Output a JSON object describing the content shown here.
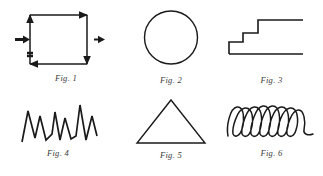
{
  "plate": {
    "background_color": "#ffffff",
    "ink_color": "#1a1a1a",
    "caption_color": "#3a3a3a",
    "columns": 3,
    "rows": 2
  },
  "figures": [
    {
      "id": "fig1",
      "caption": "Fig. 1",
      "shape_name": "square-with-direction-arrows",
      "description": "Open square outline with arrowheads indicating circulation direction and two external right-pointing arrows",
      "arrows": [
        {
          "name": "top-edge-arrow",
          "direction": "right"
        },
        {
          "name": "right-edge-arrow",
          "direction": "down"
        },
        {
          "name": "bottom-edge-arrow",
          "direction": "left"
        },
        {
          "name": "left-edge-arrow",
          "direction": "up"
        },
        {
          "name": "inlet-arrow",
          "direction": "right"
        },
        {
          "name": "outlet-arrow",
          "direction": "right"
        }
      ]
    },
    {
      "id": "fig2",
      "caption": "Fig. 2",
      "shape_name": "circle",
      "description": "Plain circle outline"
    },
    {
      "id": "fig3",
      "caption": "Fig. 3",
      "shape_name": "staircase",
      "description": "Ascending staircase profile with three rising steps and a long base line",
      "step_count": 3
    },
    {
      "id": "fig4",
      "caption": "Fig. 4",
      "shape_name": "zigzag-wave",
      "description": "Sharp sawtooth zigzag line with four peaks of varying height",
      "peak_count": 4
    },
    {
      "id": "fig5",
      "caption": "Fig. 5",
      "shape_name": "triangle",
      "description": "Isosceles triangle outline"
    },
    {
      "id": "fig6",
      "caption": "Fig. 6",
      "shape_name": "coil-helix",
      "description": "Hand-drawn coil or helix with six to seven elongated loops along a horizontal axis",
      "loop_count": 7
    }
  ]
}
